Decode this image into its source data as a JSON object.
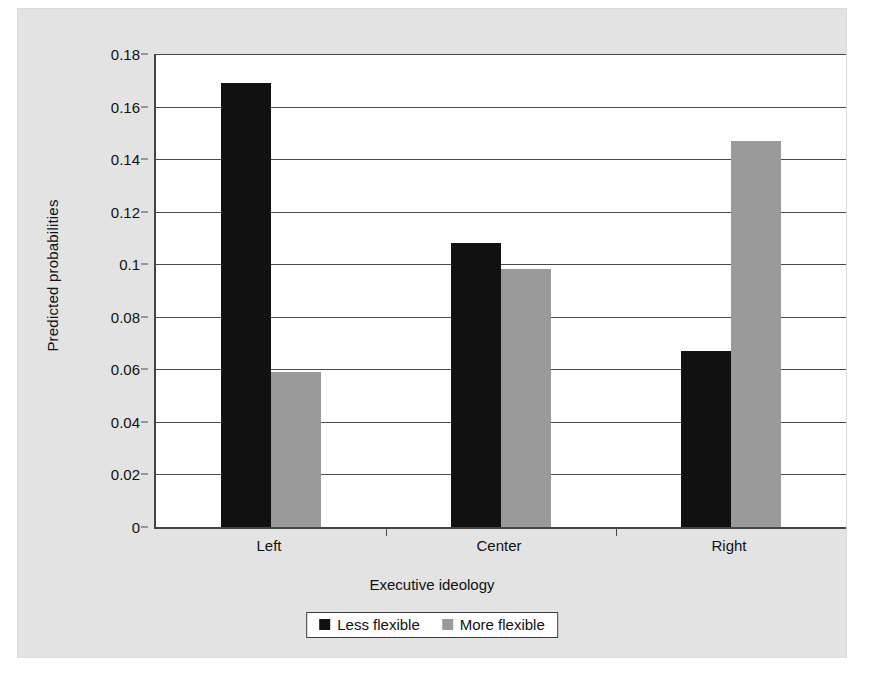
{
  "chart_data": {
    "type": "bar",
    "title": "",
    "xlabel": "Executive ideology",
    "ylabel": "Predicted probabilities",
    "categories": [
      "Left",
      "Center",
      "Right"
    ],
    "series": [
      {
        "name": "Less flexible",
        "color": "#111111",
        "values": [
          0.169,
          0.108,
          0.067
        ]
      },
      {
        "name": "More flexible",
        "color": "#9a9a9a",
        "values": [
          0.059,
          0.098,
          0.147
        ]
      }
    ],
    "ylim": [
      0,
      0.18
    ],
    "yticks": [
      0,
      0.02,
      0.04,
      0.06,
      0.08,
      0.1,
      0.12,
      0.14,
      0.16,
      0.18
    ],
    "ytick_labels": [
      "0",
      "0.02",
      "0.04",
      "0.06",
      "0.08",
      "0.1",
      "0.12",
      "0.14",
      "0.16",
      "0.18"
    ],
    "grid": "horizontal",
    "legend_position": "bottom"
  },
  "legend": {
    "items": [
      {
        "label": "Less flexible",
        "swatch": "dark"
      },
      {
        "label": "More flexible",
        "swatch": "light"
      }
    ]
  },
  "colors": {
    "panel_background": "#e3e3e3",
    "plot_background": "#ffffff",
    "axis": "#4a4a4a",
    "series_dark": "#111111",
    "series_light": "#9a9a9a"
  }
}
